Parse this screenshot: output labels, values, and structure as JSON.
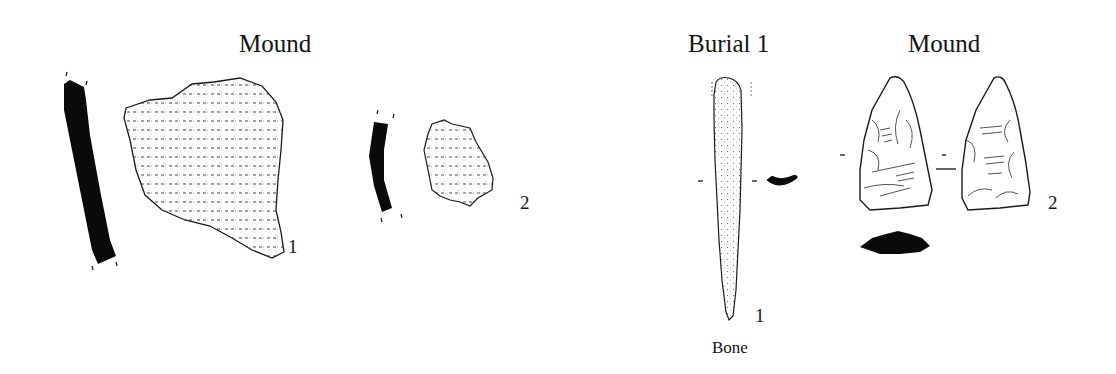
{
  "plate": {
    "left_panel": {
      "heading": "Mound",
      "items": [
        {
          "number": "1",
          "type": "pottery sherd with profile"
        },
        {
          "number": "2",
          "type": "pottery sherd with profile"
        }
      ]
    },
    "right_panel": {
      "groups": [
        {
          "heading": "Burial 1",
          "items": [
            {
              "number": "1",
              "caption": "Bone",
              "type": "bone awl with cross-section"
            }
          ]
        },
        {
          "heading": "Mound",
          "items": [
            {
              "number": "2",
              "type": "chipped stone point, two faces with cross-section"
            }
          ]
        }
      ]
    },
    "colors": {
      "ink": "#111111",
      "background": "#ffffff"
    }
  }
}
